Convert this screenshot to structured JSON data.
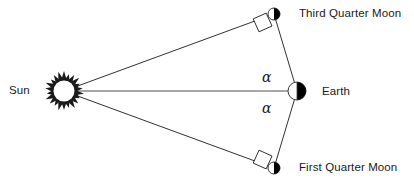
{
  "diagram": {
    "background_color": "#ffffff",
    "line_color": "#1a1a1a",
    "body_fill_color": "#000000",
    "axis_line_color": "#8a8a8a",
    "labels": {
      "sun": "Sun",
      "earth": "Earth",
      "third_quarter_moon": "Third Quarter Moon",
      "first_quarter_moon": "First Quarter Moon",
      "angle_upper": "α",
      "angle_lower": "α"
    },
    "bodies": [
      {
        "name": "sun",
        "icon": "sun-starburst-icon",
        "cx": 64,
        "cy": 91,
        "r": 17
      },
      {
        "name": "earth",
        "icon": "earth-half-shaded-icon",
        "cx": 297,
        "cy": 91,
        "r": 9
      },
      {
        "name": "third-quarter-moon",
        "icon": "moon-half-shaded-icon",
        "cx": 274,
        "cy": 14,
        "r": 6
      },
      {
        "name": "first-quarter-moon",
        "icon": "moon-half-shaded-icon",
        "cx": 274,
        "cy": 168,
        "r": 6
      }
    ],
    "lines": [
      {
        "name": "sun-to-earth-axis",
        "x1": 64,
        "y1": 91,
        "x2": 297,
        "y2": 91
      },
      {
        "name": "sun-to-third-quarter-moon-ray",
        "x1": 64,
        "y1": 91,
        "x2": 274,
        "y2": 14
      },
      {
        "name": "sun-to-first-quarter-moon-ray",
        "x1": 64,
        "y1": 91,
        "x2": 274,
        "y2": 168
      },
      {
        "name": "earth-to-third-quarter-moon",
        "x1": 297,
        "y1": 91,
        "x2": 274,
        "y2": 14
      },
      {
        "name": "earth-to-first-quarter-moon",
        "x1": 297,
        "y1": 91,
        "x2": 274,
        "y2": 168
      }
    ],
    "right_angle_markers": [
      {
        "name": "right-angle-third-quarter",
        "vertex_x": 274,
        "vertex_y": 14
      },
      {
        "name": "right-angle-first-quarter",
        "vertex_x": 274,
        "vertex_y": 168
      }
    ],
    "arrowhead": {
      "name": "sunward-arrowhead",
      "x": 64,
      "y": 91
    }
  }
}
